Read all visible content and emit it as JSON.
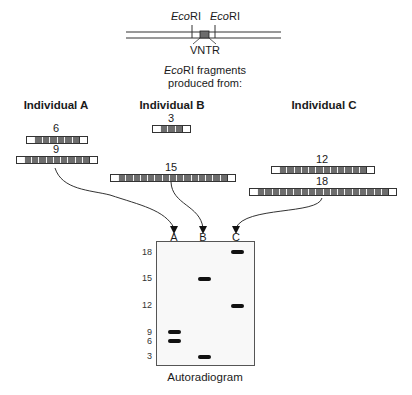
{
  "restriction_map": {
    "site_left": {
      "prefix": "Eco",
      "suffix": "RI"
    },
    "site_right": {
      "prefix": "Eco",
      "suffix": "RI"
    },
    "vntr_label": "VNTR",
    "caption_line1_prefix": "Eco",
    "caption_line1_suffix": "RI fragments",
    "caption_line2": "produced from:"
  },
  "individuals": [
    {
      "name": "Individual A",
      "fragments": [
        {
          "label": "6",
          "repeats": 6
        },
        {
          "label": "9",
          "repeats": 9
        }
      ]
    },
    {
      "name": "Individual B",
      "fragments": [
        {
          "label": "3",
          "repeats": 3
        },
        {
          "label": "15",
          "repeats": 15
        }
      ]
    },
    {
      "name": "Individual C",
      "fragments": [
        {
          "label": "12",
          "repeats": 12
        },
        {
          "label": "18",
          "repeats": 18
        }
      ]
    }
  ],
  "gel": {
    "lanes": [
      "A",
      "B",
      "C"
    ],
    "size_markers": [
      "18",
      "15",
      "12",
      "9",
      "6",
      "3"
    ],
    "bands": [
      {
        "lane": "A",
        "size": 9
      },
      {
        "lane": "A",
        "size": 6
      },
      {
        "lane": "B",
        "size": 15
      },
      {
        "lane": "B",
        "size": 3
      },
      {
        "lane": "C",
        "size": 18
      },
      {
        "lane": "C",
        "size": 12
      }
    ],
    "caption": "Autoradiogram"
  },
  "colors": {
    "repeat_unit": "#6d6d6d",
    "band": "#111111",
    "line": "#333333"
  }
}
